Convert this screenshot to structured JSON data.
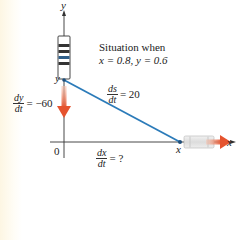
{
  "title": {
    "line1": "Situation when",
    "line2": "x = 0.8, y = 0.6"
  },
  "axes": {
    "x_label": "x",
    "y_label": "y",
    "origin_label": "0"
  },
  "points": {
    "y_point_label": "y",
    "x_point_label": "x"
  },
  "rates": {
    "dy_dt": {
      "num": "dy",
      "den": "dt",
      "value": "= −60"
    },
    "ds_dt": {
      "num": "ds",
      "den": "dt",
      "value": "= 20"
    },
    "dx_dt": {
      "num": "dx",
      "den": "dt",
      "value": "= ?"
    }
  },
  "colors": {
    "ladder_line": "#2b7bb9",
    "arrow": "#e8603c",
    "axis": "#333333",
    "carriage_fill": "#e6e6e6",
    "carriage_band": "#333333"
  }
}
